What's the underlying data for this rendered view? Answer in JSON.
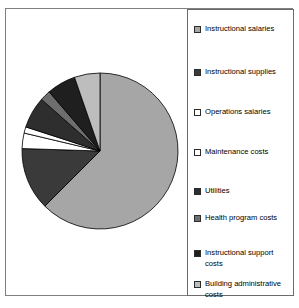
{
  "chart_data": {
    "type": "pie",
    "title": "",
    "legend_position": "right",
    "start_angle_deg": 0,
    "direction": "clockwise",
    "categories": [
      "Instructional salaries",
      "Instructional supplies",
      "Operations salaries",
      "Maintenance costs",
      "Utilities",
      "Health program costs",
      "Instructional support costs",
      "Building administrative costs"
    ],
    "values": [
      62.5,
      13.0,
      3.2,
      1.3,
      6.5,
      2.2,
      6.0,
      5.3
    ],
    "colors": [
      "#a6a6a6",
      "#3a3a3a",
      "#ffffff",
      "#ffffff",
      "#2e2e2e",
      "#6e6e6e",
      "#1f1f1f",
      "#bdbdbd"
    ],
    "slice_border": "#000000"
  },
  "legend": {
    "items": [
      {
        "label": "Instructional salaries",
        "swatch": "#a6a6a6"
      },
      {
        "label": "Instructional supplies",
        "swatch": "#3a3a3a"
      },
      {
        "label": "Operations salaries",
        "swatch": "#ffffff"
      },
      {
        "label": "Maintenance costs",
        "swatch": "#ffffff"
      },
      {
        "label": "Utilities",
        "swatch": "#2e2e2e"
      },
      {
        "label": "Health program costs",
        "swatch": "#6e6e6e"
      },
      {
        "label": "Instructional support costs",
        "swatch": "#1f1f1f"
      },
      {
        "label": "Building administrative costs",
        "swatch": "#bdbdbd"
      }
    ],
    "tops": [
      14,
      57,
      97,
      137,
      176,
      203,
      238,
      269
    ]
  }
}
